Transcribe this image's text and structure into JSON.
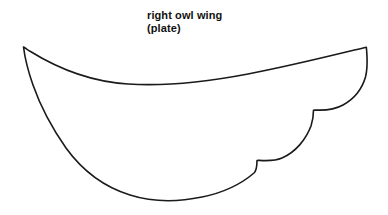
{
  "page": {
    "width": 388,
    "height": 215,
    "background_color": "#ffffff"
  },
  "caption": {
    "line1": "right owl wing",
    "line2": "(plate)"
  },
  "shape": {
    "name": "right-owl-wing-outline",
    "description": "crescent wing craft template with two scalloped notches along lower right edge",
    "stroke_color": "#1a1a1a",
    "fill_color": "#ffffff",
    "stroke_width": 1.6,
    "path": "M 23.5 47 C 24.5 55 27 68 33 85 C 40 105 52 128 66 148 C 82 170 104 187 130 195 C 152 202 178 202 202 197 C 222 193 240 185 254 173 C 256.5 170.5 257 167 257 160.5 L 258.5 160.3 C 266 160.8 274 161.5 282 158 C 296 152 306 139 311 126 C 313 120 313.5 115 313.5 110.2 L 315 110 C 324 110.5 334 110 343 105 C 354 99 362 89 365.5 77 C 367 71 367.3 63 367 56.5 C 366.8 52.5 366.6 49.5 366.3 47.2 C 330 56 290 66 248 74 C 206 82 166 86.5 128 84 C 96 82 62 71 30.5 51.5 C 28 50 25.8 48.4 23.5 47 Z",
    "anchors": {
      "left_tip": [
        23.5,
        47
      ],
      "right_tip": [
        366.3,
        47.2
      ],
      "top_edge_low_point": [
        200,
        86
      ],
      "notch_upper": [
        313.5,
        110.2
      ],
      "notch_lower": [
        257,
        160.5
      ],
      "bottom_low_point": [
        160,
        200
      ]
    }
  }
}
